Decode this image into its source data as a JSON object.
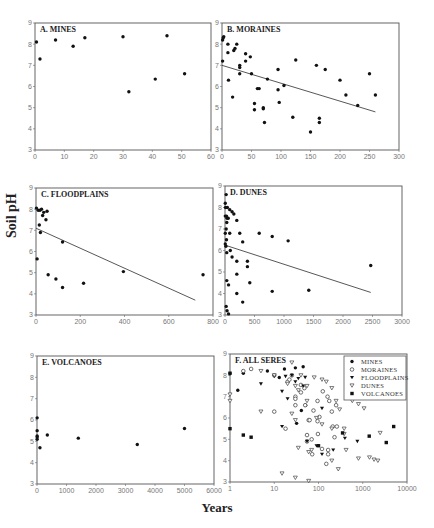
{
  "figure": {
    "y_axis_label": "Soil pH",
    "x_axis_label": "Years"
  },
  "chart_data": [
    {
      "id": "A",
      "type": "scatter",
      "title": "A. MINES",
      "xlabel": "Years",
      "ylabel": "Soil pH",
      "xlim": [
        0,
        60
      ],
      "ylim": [
        3,
        9
      ],
      "xticks": [
        0,
        10,
        20,
        30,
        40,
        50,
        60
      ],
      "yticks": [
        3,
        4,
        5,
        6,
        7,
        8,
        9
      ],
      "xscale": "linear",
      "box": [
        35,
        23,
        211,
        150
      ],
      "points": [
        [
          0.5,
          8.1
        ],
        [
          1.7,
          7.3
        ],
        [
          7,
          8.2
        ],
        [
          13,
          7.9
        ],
        [
          17,
          8.3
        ],
        [
          30,
          8.35
        ],
        [
          32,
          5.75
        ],
        [
          41,
          6.35
        ],
        [
          45,
          8.4
        ],
        [
          51,
          6.6
        ]
      ],
      "trendline": null
    },
    {
      "id": "B",
      "type": "scatter",
      "title": "B. MORAINES",
      "xlabel": "Years",
      "ylabel": "Soil pH",
      "xlim": [
        0,
        300
      ],
      "ylim": [
        3,
        9
      ],
      "xticks": [
        0,
        50,
        100,
        150,
        200,
        250,
        300
      ],
      "yticks": [
        3,
        4,
        5,
        6,
        7,
        8,
        9
      ],
      "xscale": "linear",
      "box": [
        222,
        23,
        399,
        150
      ],
      "points": [
        [
          1,
          8.2
        ],
        [
          2,
          8.3
        ],
        [
          3,
          8.35
        ],
        [
          1,
          7.2
        ],
        [
          10,
          8.0
        ],
        [
          10,
          7.6
        ],
        [
          20,
          7.7
        ],
        [
          22,
          7.8
        ],
        [
          25,
          8.0
        ],
        [
          11,
          6.3
        ],
        [
          18,
          5.5
        ],
        [
          30,
          7.0
        ],
        [
          30,
          6.9
        ],
        [
          30,
          6.6
        ],
        [
          40,
          7.55
        ],
        [
          40,
          7.2
        ],
        [
          48,
          7.4
        ],
        [
          50,
          6.6
        ],
        [
          55,
          5.2
        ],
        [
          55,
          4.9
        ],
        [
          60,
          5.9
        ],
        [
          63,
          5.9
        ],
        [
          70,
          5.0
        ],
        [
          70,
          4.95
        ],
        [
          72,
          4.3
        ],
        [
          77,
          6.35
        ],
        [
          95,
          6.8
        ],
        [
          95,
          5.85
        ],
        [
          97,
          5.25
        ],
        [
          105,
          6.05
        ],
        [
          120,
          4.55
        ],
        [
          125,
          7.25
        ],
        [
          150,
          3.85
        ],
        [
          160,
          7.0
        ],
        [
          165,
          4.5
        ],
        [
          165,
          4.3
        ],
        [
          175,
          6.8
        ],
        [
          200,
          6.3
        ],
        [
          210,
          5.6
        ],
        [
          230,
          5.1
        ],
        [
          250,
          6.6
        ],
        [
          260,
          5.6
        ]
      ],
      "trendline": [
        [
          0,
          7.0
        ],
        [
          260,
          4.8
        ]
      ]
    },
    {
      "id": "C",
      "type": "scatter",
      "title": "C. FLOODPLAINS",
      "xlabel": "Years",
      "ylabel": "Soil pH",
      "xlim": [
        0,
        800
      ],
      "ylim": [
        3,
        9
      ],
      "xticks": [
        0,
        200,
        400,
        600,
        800
      ],
      "yticks": [
        3,
        4,
        5,
        6,
        7,
        8,
        9
      ],
      "xscale": "linear",
      "box": [
        36,
        188,
        213,
        315
      ],
      "points": [
        [
          2,
          8.05
        ],
        [
          10,
          7.95
        ],
        [
          15,
          7.25
        ],
        [
          18,
          7.95
        ],
        [
          20,
          6.9
        ],
        [
          25,
          8.0
        ],
        [
          30,
          7.7
        ],
        [
          35,
          7.85
        ],
        [
          45,
          7.5
        ],
        [
          50,
          7.9
        ],
        [
          5,
          5.65
        ],
        [
          55,
          4.9
        ],
        [
          90,
          4.7
        ],
        [
          120,
          6.45
        ],
        [
          120,
          4.3
        ],
        [
          215,
          4.5
        ],
        [
          395,
          5.05
        ],
        [
          755,
          4.9
        ]
      ],
      "trendline": [
        [
          0,
          7.1
        ],
        [
          720,
          3.7
        ]
      ]
    },
    {
      "id": "D",
      "type": "scatter",
      "title": "D. DUNES",
      "xlabel": "Years",
      "ylabel": "Soil pH",
      "xlim": [
        0,
        3000
      ],
      "ylim": [
        3,
        9
      ],
      "xticks": [
        0,
        500,
        1000,
        1500,
        2000,
        2500,
        3000
      ],
      "yticks": [
        3,
        4,
        5,
        6,
        7,
        8,
        9
      ],
      "xscale": "linear",
      "box": [
        225,
        186,
        402,
        315
      ],
      "points": [
        [
          20,
          8.6
        ],
        [
          5,
          8.2
        ],
        [
          10,
          8.0
        ],
        [
          40,
          8.0
        ],
        [
          80,
          7.9
        ],
        [
          120,
          7.8
        ],
        [
          150,
          7.7
        ],
        [
          5,
          7.6
        ],
        [
          25,
          7.6
        ],
        [
          35,
          7.5
        ],
        [
          30,
          7.3
        ],
        [
          20,
          7.0
        ],
        [
          55,
          7.5
        ],
        [
          200,
          7.4
        ],
        [
          5,
          6.8
        ],
        [
          5,
          6.3
        ],
        [
          15,
          6.2
        ],
        [
          25,
          6.5
        ],
        [
          80,
          6.8
        ],
        [
          250,
          6.8
        ],
        [
          300,
          6.4
        ],
        [
          580,
          6.8
        ],
        [
          800,
          6.65
        ],
        [
          1070,
          6.45
        ],
        [
          30,
          5.9
        ],
        [
          90,
          6.0
        ],
        [
          120,
          5.7
        ],
        [
          200,
          5.5
        ],
        [
          380,
          5.5
        ],
        [
          380,
          5.25
        ],
        [
          200,
          4.9
        ],
        [
          2470,
          5.3
        ],
        [
          30,
          4.6
        ],
        [
          60,
          4.4
        ],
        [
          420,
          4.5
        ],
        [
          200,
          4.0
        ],
        [
          800,
          4.1
        ],
        [
          1420,
          4.15
        ],
        [
          300,
          3.6
        ],
        [
          20,
          3.4
        ],
        [
          35,
          3.2
        ],
        [
          60,
          3.05
        ]
      ],
      "trendline": [
        [
          0,
          6.25
        ],
        [
          2470,
          4.05
        ]
      ]
    },
    {
      "id": "E",
      "type": "scatter",
      "title": "E. VOLCANOES",
      "xlabel": "Years",
      "ylabel": "Soil pH",
      "xlim": [
        0,
        6000
      ],
      "ylim": [
        3,
        9
      ],
      "xticks": [
        0,
        1000,
        2000,
        3000,
        4000,
        5000,
        6000
      ],
      "yticks": [
        3,
        4,
        5,
        6,
        7,
        8,
        9
      ],
      "xscale": "linear",
      "box": [
        37,
        356,
        214,
        484
      ],
      "points": [
        [
          5,
          6.1
        ],
        [
          5,
          5.5
        ],
        [
          5,
          5.25
        ],
        [
          5,
          5.2
        ],
        [
          5,
          5.1
        ],
        [
          100,
          4.7
        ],
        [
          350,
          5.3
        ],
        [
          1400,
          5.15
        ],
        [
          3400,
          4.85
        ],
        [
          5000,
          5.6
        ]
      ],
      "trendline": null
    },
    {
      "id": "F",
      "type": "scatter",
      "title": "F. ALL SERES",
      "xlabel": "Years",
      "ylabel": "Soil pH",
      "xlim": [
        1,
        10000
      ],
      "ylim": [
        3,
        9
      ],
      "xticks": [
        1,
        10,
        100,
        1000,
        10000
      ],
      "yticks": [
        3,
        4,
        5,
        6,
        7,
        8,
        9
      ],
      "xscale": "log",
      "box": [
        230,
        354,
        407,
        482
      ],
      "legend": {
        "position": "upper right",
        "entries": [
          {
            "label": "MINES",
            "marker": "filled-circle"
          },
          {
            "label": "MORAINES",
            "marker": "open-circle"
          },
          {
            "label": "FLOODPLAINS",
            "marker": "filled-triangle-down"
          },
          {
            "label": "DUNES",
            "marker": "open-triangle-down"
          },
          {
            "label": "VOLCANOES",
            "marker": "filled-square"
          }
        ]
      },
      "series": [
        {
          "name": "MINES",
          "marker": "filled-circle",
          "points": [
            [
              1.5,
              7.3
            ],
            [
              7,
              8.2
            ],
            [
              13,
              7.9
            ],
            [
              17,
              8.3
            ],
            [
              30,
              8.35
            ],
            [
              32,
              5.75
            ],
            [
              41,
              6.35
            ],
            [
              45,
              8.4
            ],
            [
              51,
              6.6
            ],
            [
              2,
              8.1
            ]
          ]
        },
        {
          "name": "MORAINES",
          "marker": "open-circle",
          "points": [
            [
              2,
              8.2
            ],
            [
              3,
              8.3
            ],
            [
              10,
              8.0
            ],
            [
              10,
              6.3
            ],
            [
              18,
              5.5
            ],
            [
              20,
              7.7
            ],
            [
              22,
              7.8
            ],
            [
              25,
              8.0
            ],
            [
              30,
              7.0
            ],
            [
              30,
              6.6
            ],
            [
              30,
              6.9
            ],
            [
              40,
              7.55
            ],
            [
              40,
              7.2
            ],
            [
              48,
              7.4
            ],
            [
              50,
              6.6
            ],
            [
              55,
              5.2
            ],
            [
              55,
              4.9
            ],
            [
              60,
              5.9
            ],
            [
              63,
              5.9
            ],
            [
              70,
              5.0
            ],
            [
              72,
              4.3
            ],
            [
              77,
              6.35
            ],
            [
              95,
              6.8
            ],
            [
              95,
              5.85
            ],
            [
              97,
              5.25
            ],
            [
              105,
              6.05
            ],
            [
              120,
              4.55
            ],
            [
              125,
              7.25
            ],
            [
              150,
              3.85
            ],
            [
              160,
              7.0
            ],
            [
              165,
              4.5
            ],
            [
              165,
              4.3
            ],
            [
              175,
              6.8
            ],
            [
              200,
              6.3
            ],
            [
              210,
              5.6
            ],
            [
              230,
              5.1
            ],
            [
              250,
              6.6
            ],
            [
              260,
              5.6
            ]
          ]
        },
        {
          "name": "FLOODPLAINS",
          "marker": "filled-triangle-down",
          "points": [
            [
              1,
              8.05
            ],
            [
              10,
              7.95
            ],
            [
              15,
              7.25
            ],
            [
              18,
              7.95
            ],
            [
              20,
              6.9
            ],
            [
              25,
              8.0
            ],
            [
              30,
              7.7
            ],
            [
              35,
              7.85
            ],
            [
              45,
              7.5
            ],
            [
              50,
              7.9
            ],
            [
              5,
              7.6
            ],
            [
              15,
              5.6
            ],
            [
              55,
              4.9
            ],
            [
              90,
              4.7
            ],
            [
              120,
              6.45
            ],
            [
              120,
              4.3
            ],
            [
              215,
              4.5
            ],
            [
              395,
              5.05
            ],
            [
              755,
              4.9
            ]
          ]
        },
        {
          "name": "DUNES",
          "marker": "open-triangle-down",
          "points": [
            [
              1,
              7.1
            ],
            [
              1,
              6.8
            ],
            [
              5,
              8.2
            ],
            [
              5,
              6.3
            ],
            [
              10,
              8.0
            ],
            [
              20,
              7.6
            ],
            [
              25,
              8.6
            ],
            [
              30,
              7.5
            ],
            [
              35,
              7.3
            ],
            [
              40,
              8.0
            ],
            [
              55,
              7.5
            ],
            [
              80,
              7.9
            ],
            [
              120,
              7.8
            ],
            [
              150,
              7.7
            ],
            [
              200,
              7.4
            ],
            [
              25,
              6.2
            ],
            [
              30,
              5.9
            ],
            [
              35,
              4.6
            ],
            [
              55,
              6.8
            ],
            [
              60,
              4.4
            ],
            [
              70,
              4.5
            ],
            [
              90,
              6.0
            ],
            [
              120,
              5.7
            ],
            [
              200,
              5.5
            ],
            [
              200,
              4.0
            ],
            [
              250,
              6.8
            ],
            [
              280,
              3.6
            ],
            [
              300,
              6.4
            ],
            [
              380,
              5.5
            ],
            [
              380,
              5.25
            ],
            [
              420,
              4.5
            ],
            [
              580,
              6.8
            ],
            [
              800,
              6.65
            ],
            [
              800,
              4.1
            ],
            [
              1070,
              6.45
            ],
            [
              1420,
              4.15
            ],
            [
              1800,
              4.05
            ],
            [
              2200,
              4.0
            ],
            [
              2470,
              5.3
            ],
            [
              15,
              3.4
            ],
            [
              30,
              3.2
            ],
            [
              60,
              3.05
            ]
          ]
        },
        {
          "name": "VOLCANOES",
          "marker": "filled-square",
          "points": [
            [
              1,
              5.5
            ],
            [
              2,
              5.2
            ],
            [
              3,
              5.1
            ],
            [
              100,
              4.7
            ],
            [
              350,
              5.3
            ],
            [
              1400,
              5.15
            ],
            [
              3400,
              4.85
            ],
            [
              5000,
              5.6
            ],
            [
              1,
              8.1
            ]
          ]
        }
      ]
    }
  ]
}
